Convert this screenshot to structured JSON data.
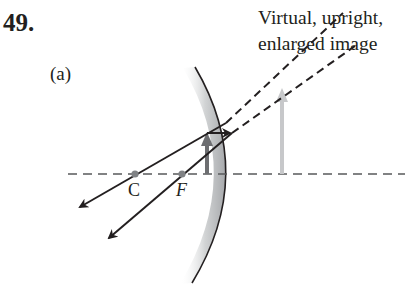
{
  "problem": {
    "number": "49.",
    "part": "(a)"
  },
  "caption": {
    "line1": "Virtual, upright,",
    "line2": "enlarged image"
  },
  "points": {
    "center": {
      "label": "C",
      "x": 135,
      "y": 174
    },
    "focus": {
      "label": "F",
      "x": 182,
      "y": 174
    }
  },
  "elements": {
    "mirror": "concave mirror",
    "object": "object arrow (dark gray, upright, between F and mirror)",
    "image": "virtual image arrow (light gray, upright, behind mirror, enlarged)",
    "optical_axis": "dashed horizontal line"
  },
  "colors": {
    "ink": "#231f20",
    "object_arrow": "#6d6e71",
    "image_arrow": "#c7c8ca",
    "mirror_shade": "#bcbec0",
    "point_dot": "#808285"
  }
}
